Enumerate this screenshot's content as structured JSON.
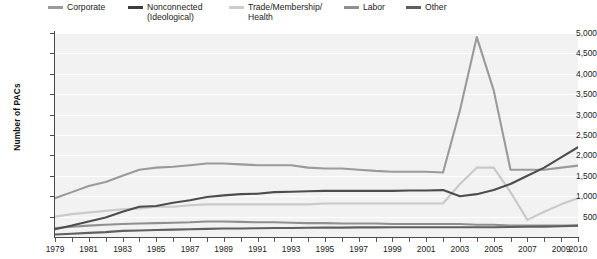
{
  "chart_data": {
    "type": "line",
    "title": "",
    "xlabel": "",
    "ylabel": "Number of PACs",
    "ylim": [
      0,
      5000
    ],
    "xlim": [
      1979,
      2010
    ],
    "grid": true,
    "legend_position": "top",
    "ytick_labels": [
      "5,000",
      "4,500",
      "4,000",
      "3,500",
      "3,000",
      "2,500",
      "2,000",
      "1,500",
      "1,000",
      "500"
    ],
    "ytick_values": [
      5000,
      4500,
      4000,
      3500,
      3000,
      2500,
      2000,
      1500,
      1000,
      500
    ],
    "xtick_labels": [
      "1979",
      "1981",
      "1983",
      "1985",
      "1987",
      "1989",
      "1991",
      "1993",
      "1995",
      "1997",
      "1999",
      "2001",
      "2003",
      "2005",
      "2007",
      "2009",
      "2010"
    ],
    "xtick_values": [
      1979,
      1981,
      1983,
      1985,
      1987,
      1989,
      1991,
      1993,
      1995,
      1997,
      1999,
      2001,
      2003,
      2005,
      2007,
      2009,
      2010
    ],
    "x": [
      1979,
      1980,
      1981,
      1982,
      1983,
      1984,
      1985,
      1986,
      1987,
      1988,
      1989,
      1990,
      1991,
      1992,
      1993,
      1994,
      1995,
      1996,
      1997,
      1998,
      1999,
      2000,
      2001,
      2002,
      2003,
      2004,
      2005,
      2006,
      2007,
      2008,
      2009,
      2010
    ],
    "series": [
      {
        "name": "Corporate",
        "color": "#9a9a9a",
        "values": [
          950,
          1100,
          1250,
          1350,
          1500,
          1650,
          1700,
          1720,
          1760,
          1800,
          1800,
          1780,
          1760,
          1760,
          1760,
          1700,
          1680,
          1680,
          1650,
          1620,
          1600,
          1600,
          1600,
          1580,
          3100,
          4900,
          3600,
          1650,
          1650,
          1650,
          1700,
          1750
        ]
      },
      {
        "name": "Nonconnected\n(Ideological)",
        "color": "#4d4d4d",
        "values": [
          190,
          280,
          380,
          480,
          620,
          740,
          760,
          840,
          900,
          980,
          1020,
          1050,
          1060,
          1100,
          1110,
          1120,
          1130,
          1130,
          1130,
          1130,
          1130,
          1140,
          1140,
          1150,
          1000,
          1050,
          1150,
          1300,
          1500,
          1700,
          1950,
          2200
        ]
      },
      {
        "name": "Trade/Membership/\nHealth",
        "color": "#c9c9c9",
        "values": [
          500,
          560,
          600,
          640,
          680,
          700,
          740,
          740,
          780,
          800,
          800,
          800,
          800,
          800,
          800,
          800,
          820,
          820,
          820,
          820,
          820,
          820,
          820,
          820,
          1300,
          1700,
          1700,
          1100,
          420,
          620,
          800,
          950
        ]
      },
      {
        "name": "Labor",
        "color": "#8f8f8f",
        "values": [
          220,
          250,
          280,
          300,
          320,
          330,
          340,
          350,
          360,
          380,
          380,
          370,
          360,
          360,
          350,
          340,
          340,
          330,
          330,
          330,
          320,
          320,
          320,
          320,
          320,
          300,
          300,
          280,
          280,
          280,
          280,
          280
        ]
      },
      {
        "name": "Other",
        "color": "#5f5f5f",
        "values": [
          60,
          80,
          100,
          120,
          150,
          160,
          170,
          180,
          190,
          200,
          210,
          210,
          215,
          220,
          220,
          225,
          230,
          230,
          235,
          235,
          240,
          240,
          240,
          240,
          240,
          240,
          240,
          245,
          250,
          255,
          265,
          280
        ]
      }
    ]
  },
  "legend": {
    "items": [
      {
        "label": "Corporate",
        "color": "#9a9a9a"
      },
      {
        "label": "Nonconnected\n(Ideological)",
        "color": "#3d3d3d"
      },
      {
        "label": "Trade/Membership/\nHealth",
        "color": "#cccccc"
      },
      {
        "label": "Labor",
        "color": "#8f8f8f"
      },
      {
        "label": "Other",
        "color": "#5f5f5f"
      }
    ]
  }
}
